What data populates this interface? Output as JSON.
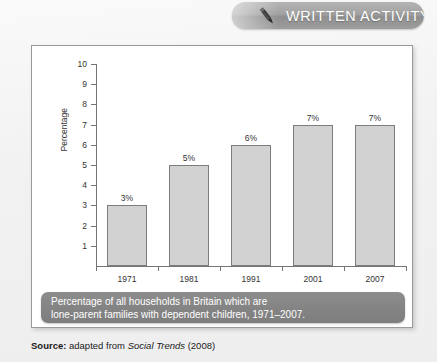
{
  "header": {
    "title": "WRITTEN ACTIVITY",
    "icon": "pen-icon",
    "banner_color": "#a2a2a2",
    "text_color": "#ffffff"
  },
  "caption": {
    "line1": "Percentage of all households in Britain which are",
    "line2": "lone-parent families with dependent children, 1971–2007.",
    "background_color": "#848484",
    "text_color": "#ffffff"
  },
  "source": {
    "label": "Source:",
    "text_before": " adapted from ",
    "publication": "Social Trends",
    "text_after": " (2008)"
  },
  "chart_data": {
    "type": "bar",
    "title": "",
    "categories": [
      "1971",
      "1981",
      "1991",
      "2001",
      "2007"
    ],
    "values": [
      3,
      5,
      6,
      7,
      7
    ],
    "data_labels": [
      "3%",
      "5%",
      "6%",
      "7%",
      "7%"
    ],
    "xlabel": "",
    "ylabel": "Percentage",
    "ylim": [
      0,
      10
    ],
    "yticks": [
      1,
      2,
      3,
      4,
      5,
      6,
      7,
      8,
      9,
      10
    ],
    "ytick_labels": [
      "1",
      "2",
      "3",
      "4",
      "5",
      "6",
      "7",
      "8",
      "9",
      "10"
    ],
    "grid": false,
    "legend": false,
    "bar_color": "#d2d2d2",
    "bar_border_color": "#7d7d7d",
    "axis_color": "#757575"
  }
}
